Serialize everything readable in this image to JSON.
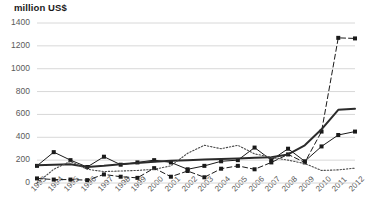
{
  "chart": {
    "axis_unit_label": "million US$",
    "y_ticks": [
      "0",
      "200",
      "400",
      "600",
      "800",
      "1000",
      "1200",
      "1400"
    ],
    "x_ticks": [
      "1993",
      "1994",
      "1995",
      "1996",
      "1997",
      "1998",
      "1999",
      "2000",
      "2001",
      "2002",
      "2003",
      "2004",
      "2005",
      "2006",
      "2007",
      "2008",
      "2009",
      "2010",
      "2011",
      "2012"
    ]
  },
  "chart_data": {
    "type": "line",
    "title": "",
    "subtitle": "",
    "xlabel": "",
    "ylabel": "million US$",
    "ylim": [
      0,
      1400
    ],
    "grid": true,
    "grid_axis": "y",
    "legend": "none",
    "x": [
      1993,
      1994,
      1995,
      1996,
      1997,
      1998,
      1999,
      2000,
      2001,
      2002,
      2003,
      2004,
      2005,
      2006,
      2007,
      2008,
      2009,
      2010,
      2011,
      2012
    ],
    "categories": [
      "1993",
      "1994",
      "1995",
      "1996",
      "1997",
      "1998",
      "1999",
      "2000",
      "2001",
      "2002",
      "2003",
      "2004",
      "2005",
      "2006",
      "2007",
      "2008",
      "2009",
      "2010",
      "2011",
      "2012"
    ],
    "series": [
      {
        "name": "series-solid-markers",
        "style": "solid",
        "marker": "square",
        "color": "#1a1a1a",
        "values": [
          150,
          270,
          200,
          140,
          230,
          160,
          180,
          200,
          180,
          120,
          150,
          190,
          200,
          310,
          200,
          300,
          190,
          320,
          420,
          450
        ]
      },
      {
        "name": "series-dashed-markers",
        "style": "dashed",
        "marker": "square",
        "color": "#1a1a1a",
        "values": [
          40,
          30,
          30,
          25,
          75,
          55,
          45,
          130,
          55,
          105,
          50,
          125,
          150,
          120,
          180,
          250,
          180,
          450,
          1270,
          1265
        ]
      },
      {
        "name": "series-thick-solid",
        "style": "solid-thick",
        "marker": "none",
        "color": "#2b2b2b",
        "values": [
          155,
          160,
          165,
          140,
          150,
          165,
          175,
          185,
          195,
          200,
          205,
          210,
          215,
          220,
          225,
          250,
          330,
          470,
          640,
          650
        ]
      },
      {
        "name": "series-dotted",
        "style": "dotted",
        "marker": "none",
        "color": "#4a4a4a",
        "values": [
          0,
          120,
          190,
          120,
          100,
          105,
          110,
          120,
          150,
          260,
          330,
          300,
          330,
          255,
          225,
          200,
          170,
          110,
          115,
          130
        ]
      }
    ]
  }
}
